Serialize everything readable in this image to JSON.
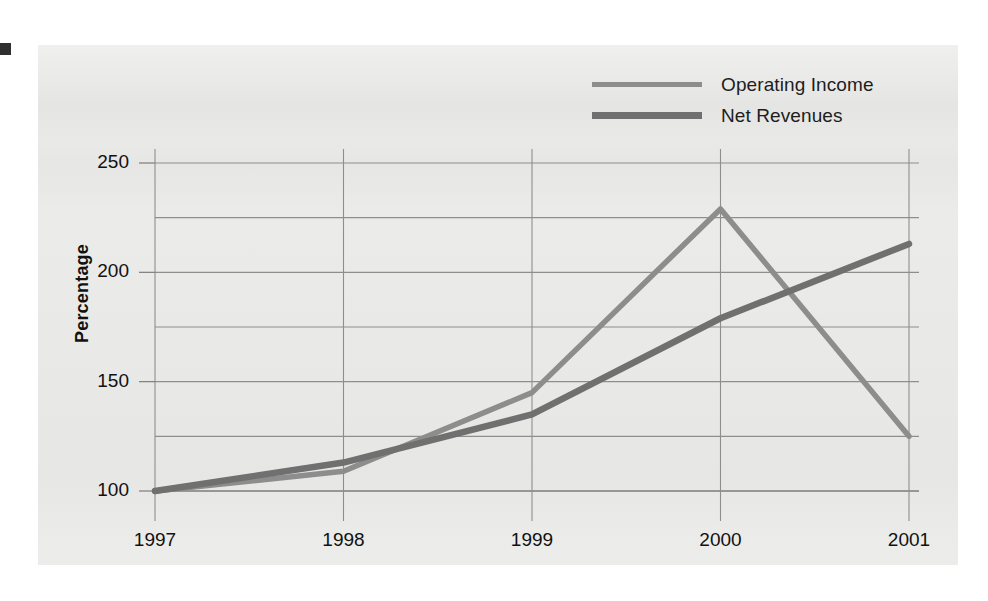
{
  "figure": {
    "background_color": "#e9e9e7",
    "page_color": "#ffffff"
  },
  "legend": {
    "position": "top-right",
    "entries": [
      {
        "label": "Operating Income",
        "color": "#8d8d8d",
        "swatch": "line-swatch-operating-income"
      },
      {
        "label": "Net Revenues",
        "color": "#707070",
        "swatch": "line-swatch-net-revenues"
      }
    ]
  },
  "axes": {
    "y_title": "Percentage",
    "y_ticks": [
      "250",
      "200",
      "150",
      "100"
    ],
    "x_ticks": [
      "1997",
      "1998",
      "1999",
      "2000",
      "2001"
    ]
  },
  "chart_data": {
    "type": "line",
    "title": "",
    "xlabel": "",
    "ylabel": "Percentage",
    "categories": [
      "1997",
      "1998",
      "1999",
      "2000",
      "2001"
    ],
    "x": [
      1997,
      1998,
      1999,
      2000,
      2001
    ],
    "series": [
      {
        "name": "Operating Income",
        "color": "#8d8d8d",
        "values": [
          100,
          109,
          145,
          229,
          125
        ]
      },
      {
        "name": "Net Revenues",
        "color": "#707070",
        "values": [
          100,
          113,
          135,
          179,
          213
        ]
      }
    ],
    "ylim": [
      100,
      250
    ],
    "xlim": [
      1997,
      2001
    ],
    "y_major_ticks": [
      100,
      150,
      200,
      250
    ],
    "y_gridlines": [
      100,
      125,
      150,
      175,
      200,
      225,
      250
    ],
    "grid": true,
    "legend_position": "top-right"
  }
}
